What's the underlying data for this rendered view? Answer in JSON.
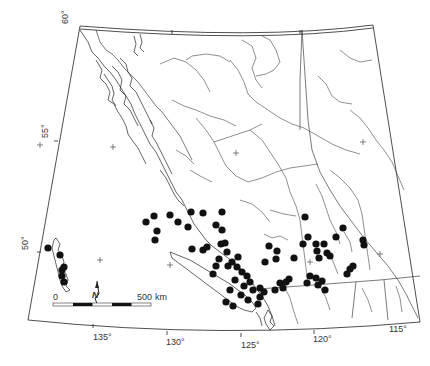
{
  "map": {
    "region": "British Columbia",
    "latitude_labels": [
      {
        "text": "60°",
        "x": 68,
        "y": 24
      },
      {
        "text": "55°",
        "x": 48,
        "y": 138
      },
      {
        "text": "50°",
        "x": 28,
        "y": 250
      }
    ],
    "longitude_labels": [
      {
        "text": "135°",
        "x": 93,
        "y": 340
      },
      {
        "text": "130°",
        "x": 166,
        "y": 345
      },
      {
        "text": "125°",
        "x": 241,
        "y": 348
      },
      {
        "text": "120°",
        "x": 313,
        "y": 342
      },
      {
        "text": "115°",
        "x": 389,
        "y": 332
      }
    ],
    "scale_bar": {
      "start_label": "0",
      "end_label": "500",
      "unit": "km"
    },
    "north_arrow": {
      "label": "N"
    },
    "grid_crosses": [
      {
        "x": 100,
        "y": 260
      },
      {
        "x": 170,
        "y": 265
      },
      {
        "x": 113,
        "y": 147
      },
      {
        "x": 40,
        "y": 145
      },
      {
        "x": 236,
        "y": 153
      },
      {
        "x": 310,
        "y": 262
      },
      {
        "x": 380,
        "y": 254
      },
      {
        "x": 363,
        "y": 142
      }
    ],
    "occurrence_dots": [
      {
        "x": 48,
        "y": 248
      },
      {
        "x": 60,
        "y": 255
      },
      {
        "x": 64,
        "y": 267
      },
      {
        "x": 62,
        "y": 270
      },
      {
        "x": 62,
        "y": 276
      },
      {
        "x": 64,
        "y": 282
      },
      {
        "x": 146,
        "y": 222
      },
      {
        "x": 154,
        "y": 216
      },
      {
        "x": 157,
        "y": 231
      },
      {
        "x": 155,
        "y": 240
      },
      {
        "x": 170,
        "y": 215
      },
      {
        "x": 178,
        "y": 222
      },
      {
        "x": 191,
        "y": 212
      },
      {
        "x": 203,
        "y": 213
      },
      {
        "x": 188,
        "y": 227
      },
      {
        "x": 222,
        "y": 212
      },
      {
        "x": 216,
        "y": 225
      },
      {
        "x": 222,
        "y": 230
      },
      {
        "x": 225,
        "y": 243
      },
      {
        "x": 192,
        "y": 249
      },
      {
        "x": 203,
        "y": 250
      },
      {
        "x": 207,
        "y": 247
      },
      {
        "x": 221,
        "y": 244
      },
      {
        "x": 227,
        "y": 252
      },
      {
        "x": 238,
        "y": 257
      },
      {
        "x": 232,
        "y": 262
      },
      {
        "x": 237,
        "y": 267
      },
      {
        "x": 228,
        "y": 266
      },
      {
        "x": 219,
        "y": 259
      },
      {
        "x": 216,
        "y": 266
      },
      {
        "x": 213,
        "y": 274
      },
      {
        "x": 242,
        "y": 272
      },
      {
        "x": 247,
        "y": 276
      },
      {
        "x": 250,
        "y": 282
      },
      {
        "x": 253,
        "y": 290
      },
      {
        "x": 260,
        "y": 288
      },
      {
        "x": 264,
        "y": 292
      },
      {
        "x": 260,
        "y": 297
      },
      {
        "x": 248,
        "y": 300
      },
      {
        "x": 241,
        "y": 295
      },
      {
        "x": 244,
        "y": 286
      },
      {
        "x": 235,
        "y": 280
      },
      {
        "x": 230,
        "y": 290
      },
      {
        "x": 226,
        "y": 302
      },
      {
        "x": 233,
        "y": 306
      },
      {
        "x": 258,
        "y": 304
      },
      {
        "x": 275,
        "y": 290
      },
      {
        "x": 280,
        "y": 283
      },
      {
        "x": 286,
        "y": 282
      },
      {
        "x": 289,
        "y": 279
      },
      {
        "x": 283,
        "y": 288
      },
      {
        "x": 265,
        "y": 262
      },
      {
        "x": 276,
        "y": 259
      },
      {
        "x": 269,
        "y": 246
      },
      {
        "x": 277,
        "y": 251
      },
      {
        "x": 305,
        "y": 217
      },
      {
        "x": 308,
        "y": 237
      },
      {
        "x": 303,
        "y": 244
      },
      {
        "x": 316,
        "y": 244
      },
      {
        "x": 317,
        "y": 251
      },
      {
        "x": 324,
        "y": 244
      },
      {
        "x": 319,
        "y": 258
      },
      {
        "x": 327,
        "y": 253
      },
      {
        "x": 336,
        "y": 237
      },
      {
        "x": 330,
        "y": 256
      },
      {
        "x": 343,
        "y": 228
      },
      {
        "x": 310,
        "y": 276
      },
      {
        "x": 316,
        "y": 278
      },
      {
        "x": 322,
        "y": 281
      },
      {
        "x": 318,
        "y": 285
      },
      {
        "x": 325,
        "y": 290
      },
      {
        "x": 347,
        "y": 274
      },
      {
        "x": 350,
        "y": 269
      },
      {
        "x": 353,
        "y": 266
      },
      {
        "x": 363,
        "y": 240
      },
      {
        "x": 364,
        "y": 245
      },
      {
        "x": 294,
        "y": 258
      },
      {
        "x": 307,
        "y": 283
      }
    ]
  }
}
